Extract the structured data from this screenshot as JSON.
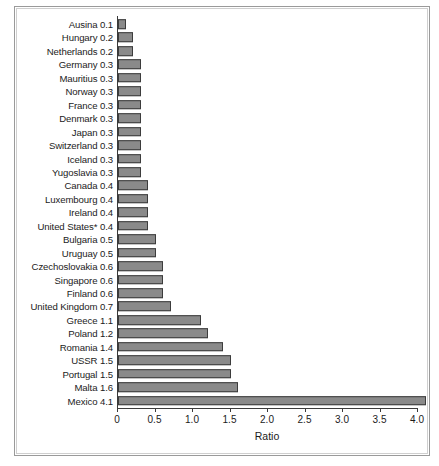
{
  "chart_data": {
    "type": "bar",
    "orientation": "horizontal",
    "title": "",
    "xlabel": "Ratio",
    "ylabel": "",
    "xlim": [
      0,
      4.2
    ],
    "xticks": [
      0,
      0.5,
      1.0,
      1.5,
      2.0,
      2.5,
      3.0,
      3.5,
      4.0
    ],
    "xticklabels": [
      "0",
      "0.5",
      "1.0",
      "1.5",
      "2.0",
      "2.5",
      "3.0",
      "3.5",
      "4.0"
    ],
    "grid": false,
    "legend": false,
    "bar_color": "#8a8a8a",
    "bar_edge_color": "#3c3c3c",
    "categories": [
      "Ausina",
      "Hungary",
      "Netherlands",
      "Germany",
      "Mauritius",
      "Norway",
      "France",
      "Denmark",
      "Japan",
      "Switzerland",
      "Iceland",
      "Yugoslavia",
      "Canada",
      "Luxembourg",
      "Ireland",
      "United States*",
      "Bulgaria",
      "Uruguay",
      "Czechoslovakia",
      "Singapore",
      "Finland",
      "United Kingdom",
      "Greece",
      "Poland",
      "Romania",
      "USSR",
      "Portugal",
      "Malta",
      "Mexico"
    ],
    "values": [
      0.1,
      0.2,
      0.2,
      0.3,
      0.3,
      0.3,
      0.3,
      0.3,
      0.3,
      0.3,
      0.3,
      0.3,
      0.4,
      0.4,
      0.4,
      0.4,
      0.5,
      0.5,
      0.6,
      0.6,
      0.6,
      0.7,
      1.1,
      1.2,
      1.4,
      1.5,
      1.5,
      1.6,
      4.1
    ],
    "rows": [
      {
        "label": "Ausina 0.1",
        "name": "Ausina",
        "value": 0.1
      },
      {
        "label": "Hungary 0.2",
        "name": "Hungary",
        "value": 0.2
      },
      {
        "label": "Netherlands 0.2",
        "name": "Netherlands",
        "value": 0.2
      },
      {
        "label": "Germany 0.3",
        "name": "Germany",
        "value": 0.3
      },
      {
        "label": "Mauritius 0.3",
        "name": "Mauritius",
        "value": 0.3
      },
      {
        "label": "Norway 0.3",
        "name": "Norway",
        "value": 0.3
      },
      {
        "label": "France 0.3",
        "name": "France",
        "value": 0.3
      },
      {
        "label": "Denmark 0.3",
        "name": "Denmark",
        "value": 0.3
      },
      {
        "label": "Japan 0.3",
        "name": "Japan",
        "value": 0.3
      },
      {
        "label": "Switzerland 0.3",
        "name": "Switzerland",
        "value": 0.3
      },
      {
        "label": "Iceland 0.3",
        "name": "Iceland",
        "value": 0.3
      },
      {
        "label": "Yugoslavia 0.3",
        "name": "Yugoslavia",
        "value": 0.3
      },
      {
        "label": "Canada 0.4",
        "name": "Canada",
        "value": 0.4
      },
      {
        "label": "Luxembourg 0.4",
        "name": "Luxembourg",
        "value": 0.4
      },
      {
        "label": "Ireland 0.4",
        "name": "Ireland",
        "value": 0.4
      },
      {
        "label": "United States* 0.4",
        "name": "United States*",
        "value": 0.4
      },
      {
        "label": "Bulgaria 0.5",
        "name": "Bulgaria",
        "value": 0.5
      },
      {
        "label": "Uruguay 0.5",
        "name": "Uruguay",
        "value": 0.5
      },
      {
        "label": "Czechoslovakia 0.6",
        "name": "Czechoslovakia",
        "value": 0.6
      },
      {
        "label": "Singapore 0.6",
        "name": "Singapore",
        "value": 0.6
      },
      {
        "label": "Finland 0.6",
        "name": "Finland",
        "value": 0.6
      },
      {
        "label": "United Kingdom 0.7",
        "name": "United Kingdom",
        "value": 0.7
      },
      {
        "label": "Greece 1.1",
        "name": "Greece",
        "value": 1.1
      },
      {
        "label": "Poland 1.2",
        "name": "Poland",
        "value": 1.2
      },
      {
        "label": "Romania 1.4",
        "name": "Romania",
        "value": 1.4
      },
      {
        "label": "USSR 1.5",
        "name": "USSR",
        "value": 1.5
      },
      {
        "label": "Portugal 1.5",
        "name": "Portugal",
        "value": 1.5
      },
      {
        "label": "Malta 1.6",
        "name": "Malta",
        "value": 1.6
      },
      {
        "label": "Mexico 4.1",
        "name": "Mexico",
        "value": 4.1
      }
    ]
  }
}
